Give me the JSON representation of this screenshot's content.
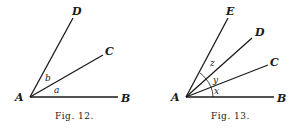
{
  "figures": [
    {
      "caption": "Fig. 12.",
      "vertex": "A",
      "rays": [
        "B",
        "C",
        "D"
      ],
      "angle_labels": [
        "a",
        "b"
      ]
    },
    {
      "caption": "Fig. 13.",
      "vertex": "A",
      "rays": [
        "B",
        "C",
        "D",
        "E"
      ],
      "angle_labels": [
        "x",
        "y",
        "z"
      ]
    }
  ],
  "colors": {
    "ink": "#1a1a1a",
    "background": "#ffffff"
  }
}
